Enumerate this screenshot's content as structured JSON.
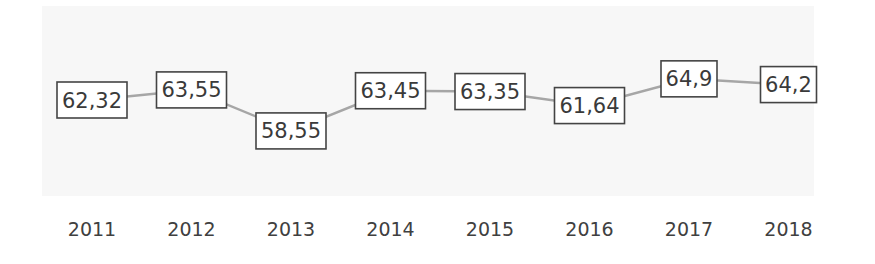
{
  "chart_data": {
    "type": "line",
    "title": "",
    "xlabel": "",
    "ylabel": "",
    "categories": [
      "2011",
      "2012",
      "2013",
      "2014",
      "2015",
      "2016",
      "2017",
      "2018"
    ],
    "series": [
      {
        "name": "",
        "values": [
          62.32,
          63.55,
          58.55,
          63.45,
          63.35,
          61.64,
          64.9,
          64.2
        ],
        "data_labels": [
          "62,32",
          "63,55",
          "58,55",
          "63,45",
          "63,35",
          "61,64",
          "64,9",
          "64,2"
        ]
      }
    ],
    "grid": false,
    "legend": "none",
    "y_axis_visible": false,
    "colors": {
      "line": "#a6a6a6",
      "label_border": "#444444",
      "text": "#3a3a3a"
    }
  }
}
